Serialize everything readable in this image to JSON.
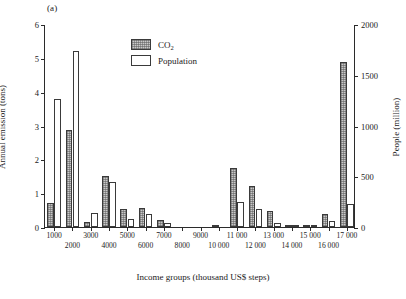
{
  "panel_label": "(a)",
  "legend": {
    "position": "inside-top-center",
    "items": [
      {
        "name": "co2",
        "label_main": "CO",
        "label_sub": "2",
        "swatch": "hatched-gray"
      },
      {
        "name": "population",
        "label_main": "Population",
        "label_sub": "",
        "swatch": "white-outline"
      }
    ]
  },
  "axes": {
    "left": {
      "title": "Annual emission (tons)",
      "ticks": [
        "0",
        "1",
        "2",
        "3",
        "4",
        "5",
        "6"
      ],
      "min": 0,
      "max": 6
    },
    "right": {
      "title": "People (million)",
      "ticks": [
        "0",
        "500",
        "1000",
        "1500",
        "2000"
      ],
      "min": 0,
      "max": 2000
    },
    "bottom": {
      "title": "Income groups (thousand US$ steps)",
      "ticks": [
        {
          "label": "1000",
          "row": 0
        },
        {
          "label": "2000",
          "row": 1
        },
        {
          "label": "3000",
          "row": 0
        },
        {
          "label": "4000",
          "row": 1
        },
        {
          "label": "5000",
          "row": 0
        },
        {
          "label": "6000",
          "row": 1
        },
        {
          "label": "7000",
          "row": 0
        },
        {
          "label": "8000",
          "row": 1
        },
        {
          "label": "9000",
          "row": 0
        },
        {
          "label": "10 000",
          "row": 1
        },
        {
          "label": "11 000",
          "row": 0
        },
        {
          "label": "12 000",
          "row": 1
        },
        {
          "label": "13 000",
          "row": 0
        },
        {
          "label": "14 000",
          "row": 1
        },
        {
          "label": "15 000",
          "row": 0
        },
        {
          "label": "16 000",
          "row": 1
        },
        {
          "label": "17 000",
          "row": 0
        }
      ]
    }
  },
  "chart_data": {
    "type": "bar",
    "title": "",
    "subtitle": "",
    "xlabel": "Income groups (thousand US$ steps)",
    "ylabel": "Annual emission (tons)",
    "ylabel_secondary": "People (million)",
    "ylim": [
      0,
      6
    ],
    "ylim_secondary": [
      0,
      2000
    ],
    "grid": false,
    "legend_position": "inside-top-center",
    "categories": [
      "1000",
      "2000",
      "3000",
      "4000",
      "5000",
      "6000",
      "7000",
      "8000",
      "9000",
      "10 000",
      "11 000",
      "12 000",
      "13 000",
      "14 000",
      "15 000",
      "16 000",
      "17 000"
    ],
    "series": [
      {
        "name": "CO2",
        "axis": "left",
        "unit": "tons",
        "values": [
          0.7,
          2.88,
          0.15,
          1.5,
          0.52,
          0.55,
          0.22,
          0.0,
          0.0,
          0.06,
          1.75,
          1.22,
          0.47,
          0.05,
          0.04,
          0.38,
          4.87
        ]
      },
      {
        "name": "Population",
        "axis": "right",
        "unit": "million",
        "values": [
          1265,
          1735,
          140,
          440,
          82,
          125,
          38,
          0,
          0,
          0,
          250,
          180,
          40,
          20,
          15,
          60,
          230
        ]
      }
    ]
  }
}
